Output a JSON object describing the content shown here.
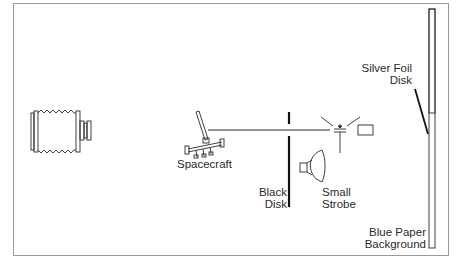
{
  "diagram": {
    "type": "photographic setup schematic",
    "components": [
      {
        "id": "camera",
        "icon": "camera-bellows-icon"
      },
      {
        "id": "spacecraft",
        "label": "Spacecraft",
        "icon": "spacecraft-model-icon"
      },
      {
        "id": "black_disk",
        "label_line1": "Black",
        "label_line2": "Disk"
      },
      {
        "id": "small_strobe",
        "label_line1": "Small",
        "label_line2": "Strobe",
        "icon": "strobe-icon"
      },
      {
        "id": "light_source",
        "icon": "spotlight-icon"
      },
      {
        "id": "silver_foil_disk",
        "label_line1": "Silver Foil",
        "label_line2": "Disk"
      },
      {
        "id": "blue_paper_background",
        "label_line1": "Blue Paper",
        "label_line2": "Background"
      }
    ],
    "colors": {
      "line": "#1a1a1a",
      "frame": "#9a9a9a",
      "background": "#ffffff"
    }
  },
  "labels": {
    "spacecraft": "Spacecraft",
    "black_disk_1": "Black",
    "black_disk_2": "Disk",
    "small_strobe_1": "Small",
    "small_strobe_2": "Strobe",
    "silver_foil_1": "Silver Foil",
    "silver_foil_2": "Disk",
    "blue_paper_1": "Blue Paper",
    "blue_paper_2": "Background"
  }
}
